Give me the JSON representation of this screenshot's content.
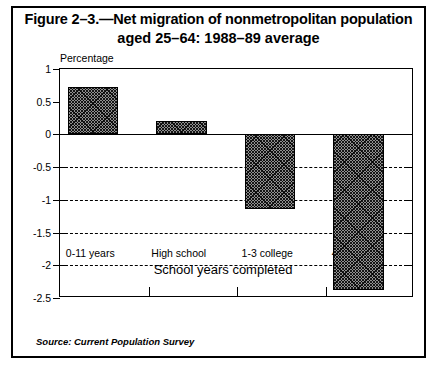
{
  "figure": {
    "title_line1": "Figure 2–3.—Net migration of nonmetropolitan population",
    "title_line2": "aged 25–64: 1988–89 average",
    "source_note": "Source: Current Population Survey"
  },
  "chart_data": {
    "type": "bar",
    "title": "Figure 2–3.—Net migration of nonmetropolitan population aged 25–64: 1988–89 average",
    "categories": [
      "0-11 years",
      "High school",
      "1-3 college",
      "4+ college"
    ],
    "values": [
      0.72,
      0.2,
      -1.14,
      -2.38
    ],
    "xlabel": "School years completed",
    "ylabel": "Percentage",
    "ylim": [
      -2.5,
      1
    ],
    "yticks": [
      1,
      0.5,
      0,
      -0.5,
      -1,
      -1.5,
      -2,
      -2.5
    ],
    "ytick_labels": [
      "1",
      "0.5",
      "0",
      "-0.5",
      "-1",
      "-1.5",
      "-2",
      "-2.5"
    ],
    "grid": "dashed horizontal gridlines at -0.5, -1, -1.5, -2",
    "legend": "none",
    "bar_fill": "#8f8f8f",
    "bar_pattern": "crosshatch",
    "bar_edge_color": "#000000"
  }
}
